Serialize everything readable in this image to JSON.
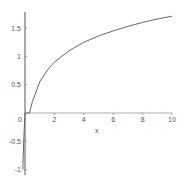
{
  "chart_data": {
    "type": "line",
    "title": "",
    "xlabel": "x",
    "ylabel": "",
    "xlim": [
      0,
      10
    ],
    "ylim": [
      -1,
      1.75
    ],
    "grid": false,
    "legend": null,
    "x_ticks": [
      "0",
      "2",
      "4",
      "6",
      "8",
      "10"
    ],
    "y_ticks": [
      "-1",
      "-0.5",
      "1",
      "1.5",
      "0.5"
    ],
    "y_tick_values": [
      -1,
      -0.5,
      1,
      1.5,
      0.5
    ],
    "x_tick_values": [
      0,
      2,
      4,
      6,
      8,
      10
    ],
    "series": [
      {
        "name": "f(x)",
        "color": "#666666",
        "x": [
          -0.15,
          -0.1,
          -0.05,
          0,
          0.3,
          0.5,
          1,
          1.56,
          2,
          3,
          4,
          5,
          6,
          7,
          8,
          9,
          10
        ],
        "y": [
          -1.0,
          -0.6,
          -0.25,
          0,
          0.0,
          0.2,
          0.55,
          0.77,
          0.9,
          1.1,
          1.25,
          1.36,
          1.45,
          1.53,
          1.6,
          1.66,
          1.71
        ]
      }
    ]
  }
}
